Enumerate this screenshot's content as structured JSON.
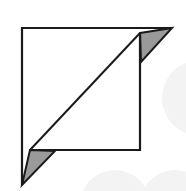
{
  "diagram": {
    "title": "",
    "shape": "folded-square-icon",
    "colors": {
      "background": "#ffffff",
      "stroke": "#1a1a1a",
      "fold_fill": "#9a9a9a",
      "face_fill": "#ffffff",
      "watermark": "#f2f2f2"
    }
  }
}
